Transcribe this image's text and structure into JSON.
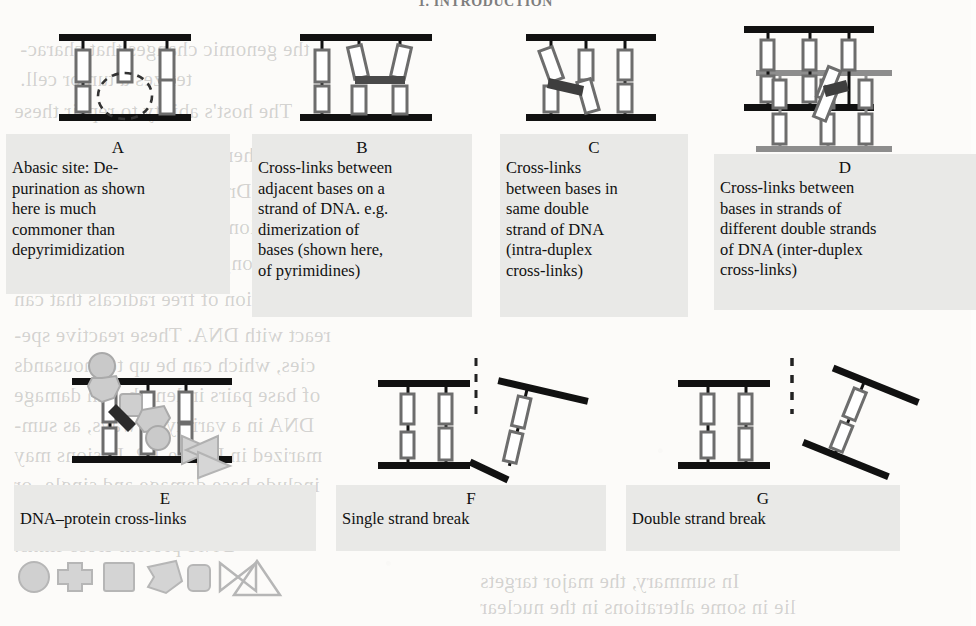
{
  "document": {
    "running_head": "1. INTRODUCTION",
    "figure_type": "DNA damage types schematic"
  },
  "showthrough": {
    "note": "faint mirrored text bleeding through from the reverse side of the page",
    "lines": [
      {
        "text": "the genomic changes that charac-",
        "x": 20,
        "y": 34
      },
      {
        "text": "terizes a tumor cell.",
        "x": 20,
        "y": 64
      },
      {
        "text": "The host's ability to repair these",
        "x": 14,
        "y": 96
      },
      {
        "text": "Chemotherapeutics are well-known",
        "x": 14,
        "y": 140
      },
      {
        "text": "1.2.2  \"Driver Genes\" in Radiation",
        "x": 14,
        "y": 176
      },
      {
        "text": "Radiation damages DNA by direct",
        "x": 14,
        "y": 212
      },
      {
        "text": "ionization, and more commonly by",
        "x": 14,
        "y": 248
      },
      {
        "text": "the creation of free radicals that can",
        "x": 14,
        "y": 284
      },
      {
        "text": "react with DNA. These reactive spe-",
        "x": 14,
        "y": 320
      },
      {
        "text": "cies, which can be up to thousands",
        "x": 14,
        "y": 350
      },
      {
        "text": "of base pairs in length, can damage",
        "x": 14,
        "y": 380
      },
      {
        "text": "DNA in a variety of ways, as sum-",
        "x": 14,
        "y": 410
      },
      {
        "text": "marized in Figure 1.2. Lesions may",
        "x": 14,
        "y": 440
      },
      {
        "text": "include base damage and single- or",
        "x": 14,
        "y": 470
      },
      {
        "text": "double-strand breaks, as well as",
        "x": 14,
        "y": 500
      },
      {
        "text": "DNA-protein cross-links.",
        "x": 14,
        "y": 530
      },
      {
        "text": "In summary, the major targets",
        "x": 480,
        "y": 566
      },
      {
        "text": "lie in some alterations in the nuclear",
        "x": 480,
        "y": 592
      }
    ]
  },
  "panels": [
    {
      "id": "A",
      "letter": "A",
      "caption": "Abasic site: De-purination as shown here is much commoner than depyrimidization",
      "caption_lines": [
        "Abasic site: De-",
        "purination as shown",
        "here is much",
        "commoner than",
        "depyrimidization"
      ],
      "diagram": "abasic-site",
      "diagram_description": "DNA duplex with a missing base shown as a dashed circle"
    },
    {
      "id": "B",
      "letter": "B",
      "caption": "Cross-links between adjacent  bases on a strand of DNA. e.g. dimerization of bases (shown here, of pyrimidines)",
      "caption_lines": [
        "Cross-links between",
        "adjacent  bases on a",
        "strand of DNA. e.g.",
        "dimerization of",
        "bases (shown here,",
        "of pyrimidines)"
      ],
      "diagram": "adjacent-base-crosslink",
      "diagram_description": "two tilted bases on the same strand joined by a dark bar"
    },
    {
      "id": "C",
      "letter": "C",
      "caption": "Cross-links between bases in same double strand of DNA (intra-duplex cross-links)",
      "caption_lines": [
        "Cross-links",
        "between bases in",
        "same double",
        "strand of DNA",
        "(intra-duplex",
        "cross-links)"
      ],
      "diagram": "intra-duplex-crosslink",
      "diagram_description": "two opposing bases in one duplex joined by a dark bar"
    },
    {
      "id": "D",
      "letter": "D",
      "caption": "Cross-links between bases in strands of different double strands of DNA (inter-duplex cross-links)",
      "caption_lines": [
        "Cross-links between",
        "bases in strands of",
        "different double strands",
        "of DNA (inter-duplex",
        "cross-links)"
      ],
      "diagram": "inter-duplex-crosslink",
      "diagram_description": "two stacked duplexes, one black one grey, joined by a dark bar"
    },
    {
      "id": "E",
      "letter": "E",
      "caption": "DNA–protein cross-links",
      "caption_lines": [
        "DNA–protein cross-links"
      ],
      "diagram": "dna-protein-crosslink",
      "diagram_description": "DNA strand with grey protein blobs bound to bases",
      "legend_shapes": [
        "circle",
        "cross-blob",
        "square",
        "arrow-blob",
        "rounded-square",
        "bowtie",
        "triangle"
      ]
    },
    {
      "id": "F",
      "letter": "F",
      "caption": "Single strand break",
      "caption_lines": [
        "Single strand break"
      ],
      "diagram": "single-strand-break",
      "diagram_description": "duplex with one backbone severed, the fragment tilted away"
    },
    {
      "id": "G",
      "letter": "G",
      "caption": "Double strand break",
      "caption_lines": [
        "Double strand break"
      ],
      "diagram": "double-strand-break",
      "diagram_description": "duplex fully severed, dashed line marks the break, fragment tilted away"
    }
  ],
  "colors": {
    "page": "#fcfbf9",
    "ink": "#111111",
    "caption_bg": "#e9e9e7",
    "base_outline": "#6d6d6d",
    "strand_black": "#111111",
    "strand_grey": "#8d8d8d",
    "protein_grey": "#b9b9b9",
    "showthrough": "rgba(40,40,40,.20)"
  }
}
